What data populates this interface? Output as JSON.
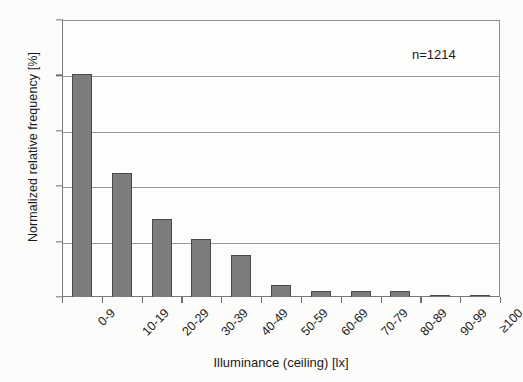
{
  "chart_data": {
    "type": "bar",
    "title": "",
    "subtitle": "",
    "xlabel": "Illuminance (ceiling) [lx]",
    "ylabel": "Normalized relative frequency [%]",
    "categories": [
      "0-9",
      "10-19",
      "20-29",
      "30-39",
      "40-49",
      "50-59",
      "60-69",
      "70-79",
      "80-89",
      "90-99",
      "≥100"
    ],
    "values": [
      40.2,
      22.4,
      14.0,
      10.5,
      7.6,
      2.2,
      1.1,
      1.0,
      1.0,
      0.4,
      0.2
    ],
    "series": [
      {
        "name": "Normalized relative frequency",
        "values": [
          40.2,
          22.4,
          14.0,
          10.5,
          7.6,
          2.2,
          1.1,
          1.0,
          1.0,
          0.4,
          0.2
        ]
      }
    ],
    "ylim": [
      0,
      50
    ],
    "yticks": [
      0,
      10,
      20,
      30,
      40,
      50
    ],
    "ytick_labels": [
      "0",
      "10",
      "20",
      "30",
      "40",
      "50"
    ],
    "grid": "horizontal",
    "legend": "none",
    "bar_color": "#7d7d7d",
    "bar_edge_color": "#4a4a4a",
    "grid_color": "#9a9a9a",
    "axis_color": "#7a7a7a",
    "annotations": [
      {
        "name": "sample-size",
        "text": "n=1214"
      }
    ]
  },
  "annotation": {
    "sample_size": "n=1214"
  },
  "axes": {
    "x_title": "Illuminance (ceiling) [lx]",
    "y_title": "Normalized relative frequency [%]"
  }
}
